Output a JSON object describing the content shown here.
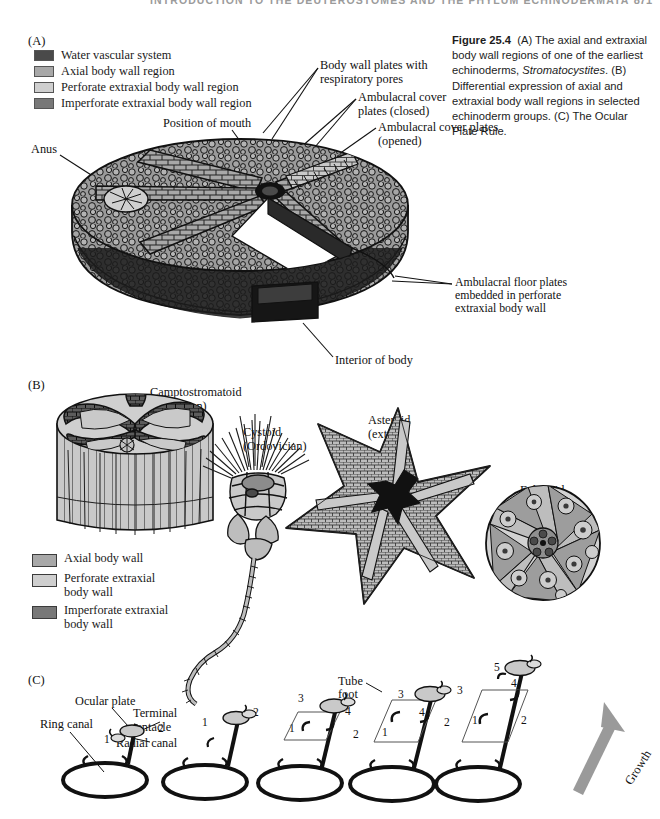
{
  "running_head": {
    "text": "INTRODUCTION TO THE DEUTEROSTOMES AND THE PHYLUM ECHINODERMATA",
    "page_number": "871"
  },
  "caption": {
    "figure_number": "Figure 25.4",
    "part_a": "(A) The axial and extraxial body wall regions of one of the earliest echinoderms,",
    "genus": "Stromatocystites",
    "part_b": ". (B) Differential expression of axial and extraxial body wall regions in selected echinoderm groups. (C) The Ocular Plate Rule."
  },
  "colors": {
    "water_vascular": "#4a4a4a",
    "axial": "#a8a8a8",
    "perforate": "#cfcfcf",
    "imperforate": "#787878",
    "outline": "#1a1a1a",
    "growth_arrow": "#9a9a9a",
    "runhead": "#9b9b9b"
  },
  "panel_a": {
    "letter": "(A)",
    "legend": [
      {
        "label": "Water vascular system",
        "color": "#4a4a4a"
      },
      {
        "label": "Axial body wall region",
        "color": "#a8a8a8"
      },
      {
        "label": "Perforate extraxial body wall region",
        "color": "#cfcfcf"
      },
      {
        "label": "Imperforate extraxial body wall region",
        "color": "#787878"
      }
    ],
    "labels": {
      "body_wall_plates": "Body wall plates with\nrespiratory pores",
      "cover_plates_closed": "Ambulacral cover\nplates (closed)",
      "cover_plates_opened": "Ambulacral cover plates\n(opened)",
      "position_of_mouth": "Position of mouth",
      "anus": "Anus",
      "ambulacral_floor_plates": "Ambulacral floor plates\nembedded in perforate\nextraxial body wall",
      "interior_of_body": "Interior of body"
    }
  },
  "panel_b": {
    "letter": "(B)",
    "specimens": [
      {
        "name": "Camptostromatoid",
        "period": "(Cambrian)"
      },
      {
        "name": "Cystoid",
        "period": "(Ordovician)"
      },
      {
        "name": "Asteroid",
        "period": "(extant)"
      },
      {
        "name": "Echinoid",
        "period": "(extant)"
      }
    ],
    "legend": [
      {
        "label": "Axial body wall",
        "color": "#a8a8a8"
      },
      {
        "label": "Perforate extraxial\nbody wall",
        "color": "#cfcfcf"
      },
      {
        "label": "Imperforate extraxial\nbody wall",
        "color": "#787878"
      }
    ]
  },
  "panel_c": {
    "letter": "(C)",
    "labels": {
      "ocular_plate": "Ocular plate",
      "terminal_tentacle": "Terminal\ntentacle",
      "ring_canal": "Ring canal",
      "radial_canal": "Radial canal",
      "tube_foot": "Tube\nfoot",
      "growth": "Growth"
    },
    "stages": [
      {
        "numbers": [
          "1",
          "2"
        ]
      },
      {
        "numbers": [
          "1",
          "2"
        ]
      },
      {
        "numbers": [
          "1",
          "2",
          "3",
          "4"
        ]
      },
      {
        "numbers": [
          "1",
          "2",
          "3",
          "4"
        ]
      },
      {
        "numbers": [
          "1",
          "2",
          "3",
          "4",
          "5"
        ]
      }
    ]
  }
}
